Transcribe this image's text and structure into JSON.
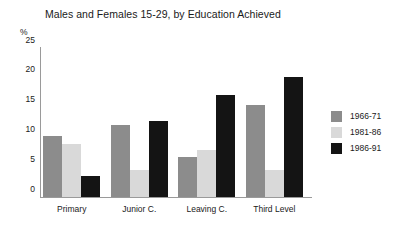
{
  "chart_data": {
    "type": "bar",
    "title": "Males and Females 15-29, by Education Achieved",
    "xlabel": "",
    "ylabel": "%",
    "ylim": [
      0,
      25
    ],
    "yticks": [
      0,
      5,
      10,
      15,
      20,
      25
    ],
    "grid": false,
    "legend_position": "right",
    "categories": [
      "Primary",
      "Junior C.",
      "Leaving C.",
      "Third Level"
    ],
    "series": [
      {
        "name": "1966-71",
        "color": "#8c8c8c",
        "values": [
          10.3,
          12.0,
          6.7,
          15.4
        ]
      },
      {
        "name": "1981-86",
        "color": "#d9d9d9",
        "values": [
          8.9,
          4.5,
          7.9,
          4.6
        ]
      },
      {
        "name": "1986-91",
        "color": "#141414",
        "values": [
          3.6,
          12.7,
          17.1,
          20.2
        ]
      }
    ]
  }
}
